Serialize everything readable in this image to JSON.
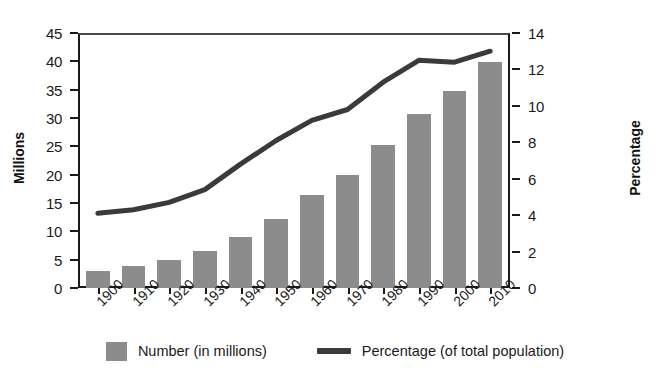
{
  "chart_data": {
    "type": "bar",
    "title": "",
    "subtitle": "",
    "xlabel": "",
    "ylabel": "Millions",
    "y2label": "Percentage",
    "categories": [
      "1900",
      "1910",
      "1920",
      "1930",
      "1940",
      "1950",
      "1960",
      "1970",
      "1980",
      "1990",
      "2000",
      "2010"
    ],
    "ylim": [
      0,
      45
    ],
    "y2lim": [
      0,
      14
    ],
    "yticks": [
      0,
      5,
      10,
      15,
      20,
      25,
      30,
      35,
      40,
      45
    ],
    "y2ticks": [
      0,
      2,
      4,
      6,
      8,
      10,
      12,
      14
    ],
    "grid": false,
    "legend_position": "bottom",
    "series": [
      {
        "name": "Number (in millions)",
        "type": "bar",
        "axis": "left",
        "color": "#8c8c8c",
        "values": [
          3.1,
          3.9,
          4.9,
          6.6,
          9.0,
          12.3,
          16.6,
          20.1,
          25.5,
          31.0,
          35.0,
          40.2
        ]
      },
      {
        "name": "Percentage (of total population)",
        "type": "line",
        "axis": "right",
        "color": "#3a3a3a",
        "values": [
          4.1,
          4.3,
          4.7,
          5.4,
          6.8,
          8.1,
          9.2,
          9.8,
          11.3,
          12.5,
          12.4,
          13.0
        ]
      }
    ]
  },
  "axes": {
    "left_title": "Millions",
    "right_title": "Percentage"
  },
  "legend": {
    "items": [
      {
        "label": "Number (in millions)",
        "marker": "bar-swatch"
      },
      {
        "label": "Percentage (of total population)",
        "marker": "line-swatch"
      }
    ]
  }
}
